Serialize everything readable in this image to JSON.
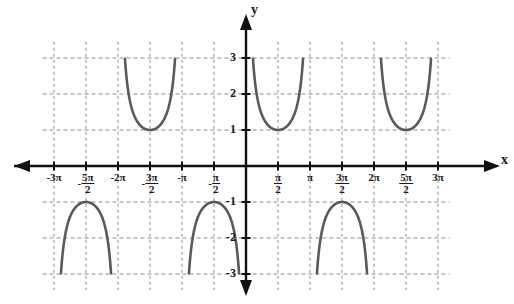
{
  "graph": {
    "title": "Graph of y = csc(x)",
    "axis_labels": {
      "x": "x",
      "y": "y"
    },
    "x_ticks": [
      {
        "value": -3.0,
        "label": "-3π",
        "kind": "plain"
      },
      {
        "value": -2.5,
        "label": "-5π/2",
        "kind": "fraction",
        "sign": "-",
        "num": "5π",
        "den": "2"
      },
      {
        "value": -2.0,
        "label": "-2π",
        "kind": "plain"
      },
      {
        "value": -1.5,
        "label": "-3π/2",
        "kind": "fraction",
        "sign": "-",
        "num": "3π",
        "den": "2"
      },
      {
        "value": -1.0,
        "label": "-π",
        "kind": "plain"
      },
      {
        "value": -0.5,
        "label": "-π/2",
        "kind": "fraction",
        "sign": "-",
        "num": "π",
        "den": "2"
      },
      {
        "value": 0.5,
        "label": "π/2",
        "kind": "fraction",
        "sign": "",
        "num": "π",
        "den": "2"
      },
      {
        "value": 1.0,
        "label": "π",
        "kind": "plain"
      },
      {
        "value": 1.5,
        "label": "3π/2",
        "kind": "fraction",
        "sign": "",
        "num": "3π",
        "den": "2"
      },
      {
        "value": 2.0,
        "label": "2π",
        "kind": "plain"
      },
      {
        "value": 2.5,
        "label": "5π/2",
        "kind": "fraction",
        "sign": "",
        "num": "5π",
        "den": "2"
      },
      {
        "value": 3.0,
        "label": "3π",
        "kind": "plain"
      }
    ],
    "y_ticks": [
      {
        "value": 3,
        "label": "3"
      },
      {
        "value": 2,
        "label": "2"
      },
      {
        "value": 1,
        "label": "1"
      },
      {
        "value": -1,
        "label": "-1"
      },
      {
        "value": -2,
        "label": "-2"
      },
      {
        "value": -3,
        "label": "-3"
      }
    ],
    "colors": {
      "curve": "#595959",
      "axis": "#101010",
      "grid": "#8c8c8c",
      "text": "#1a1a1a",
      "background": "#ffffff"
    }
  },
  "chart_data": {
    "type": "line",
    "function": "y = csc(x) = 1/sin(x)",
    "xlabel": "x",
    "ylabel": "y",
    "xlim": [
      -3.2,
      3.2
    ],
    "ylim": [
      -3.4,
      3.4
    ],
    "x_unit": "pi",
    "grid": true,
    "grid_x_step": 0.5,
    "grid_y_step": 1,
    "legend": "none",
    "asymptotes": [
      -3.0,
      -2.0,
      -1.0,
      0.0,
      1.0,
      2.0,
      3.0
    ],
    "branches": [
      {
        "interval": [
          -3.0,
          -2.0
        ],
        "direction": "down",
        "extremum": {
          "x": -2.5,
          "y": -1
        },
        "clip": -3
      },
      {
        "interval": [
          -2.0,
          -1.0
        ],
        "direction": "up",
        "extremum": {
          "x": -1.5,
          "y": 1
        },
        "clip": 3
      },
      {
        "interval": [
          -1.0,
          0.0
        ],
        "direction": "down",
        "extremum": {
          "x": -0.5,
          "y": -1
        },
        "clip": -3
      },
      {
        "interval": [
          0.0,
          1.0
        ],
        "direction": "up",
        "extremum": {
          "x": 0.5,
          "y": 1
        },
        "clip": 3
      },
      {
        "interval": [
          1.0,
          2.0
        ],
        "direction": "down",
        "extremum": {
          "x": 1.5,
          "y": -1
        },
        "clip": -3
      },
      {
        "interval": [
          2.0,
          3.0
        ],
        "direction": "up",
        "extremum": {
          "x": 2.5,
          "y": 1
        },
        "clip": 3
      }
    ],
    "key_points": [
      {
        "x": -2.5,
        "y": -1
      },
      {
        "x": -1.5,
        "y": 1
      },
      {
        "x": -0.5,
        "y": -1
      },
      {
        "x": 0.5,
        "y": 1
      },
      {
        "x": 1.5,
        "y": -1
      },
      {
        "x": 2.5,
        "y": 1
      }
    ]
  }
}
